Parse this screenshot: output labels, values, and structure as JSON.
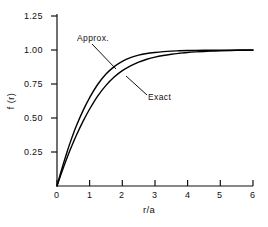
{
  "chart_data": {
    "type": "line",
    "title": "",
    "xlabel": "r/a",
    "ylabel": "f (r)",
    "xlim": [
      0,
      6
    ],
    "ylim": [
      0,
      1.25
    ],
    "grid": false,
    "legend_position": "inline-annotations",
    "xticks": [
      0,
      1,
      2,
      3,
      4,
      5,
      6
    ],
    "xtick_labels": [
      "0",
      "1",
      "2",
      "3",
      "4",
      "5",
      "6"
    ],
    "yticks": [
      0.25,
      0.5,
      0.75,
      1.0,
      1.25
    ],
    "ytick_labels": [
      "0.25",
      "0.50",
      "0.75",
      "1.00",
      "1.25"
    ],
    "annotations": [
      {
        "text": "Approx.",
        "x": 0.9,
        "y": 1.18
      },
      {
        "text": "Exact",
        "x": 2.8,
        "y": 0.82
      }
    ],
    "series": [
      {
        "name": "Approx.",
        "x": [
          0.0,
          0.1,
          0.2,
          0.3,
          0.4,
          0.5,
          0.6,
          0.8,
          1.0,
          1.25,
          1.5,
          1.75,
          2.0,
          2.25,
          2.5,
          2.75,
          3.0,
          3.25,
          3.5,
          3.75,
          4.0,
          4.25,
          4.5,
          4.75,
          5.0,
          5.5,
          6.0
        ],
        "values": [
          0.0,
          0.086,
          0.168,
          0.245,
          0.317,
          0.384,
          0.447,
          0.556,
          0.65,
          0.748,
          0.823,
          0.878,
          0.917,
          0.944,
          0.962,
          0.974,
          0.982,
          0.988,
          0.992,
          0.994,
          0.996,
          0.997,
          0.998,
          0.9985,
          0.999,
          0.9995,
          1.0
        ]
      },
      {
        "name": "Exact",
        "x": [
          0.0,
          0.1,
          0.2,
          0.3,
          0.4,
          0.5,
          0.6,
          0.8,
          1.0,
          1.25,
          1.5,
          1.75,
          2.0,
          2.25,
          2.5,
          2.75,
          3.0,
          3.25,
          3.5,
          3.75,
          4.0,
          4.25,
          4.5,
          4.75,
          5.0,
          5.5,
          6.0
        ],
        "values": [
          0.0,
          0.07,
          0.138,
          0.202,
          0.264,
          0.322,
          0.377,
          0.477,
          0.566,
          0.663,
          0.74,
          0.801,
          0.848,
          0.884,
          0.911,
          0.932,
          0.948,
          0.96,
          0.969,
          0.976,
          0.982,
          0.986,
          0.989,
          0.992,
          0.994,
          0.997,
          0.999
        ]
      }
    ],
    "axis_color": "#111111",
    "line_color": "#000000"
  },
  "axes": {
    "x_title": "r/a",
    "y_title": "f (r)"
  }
}
